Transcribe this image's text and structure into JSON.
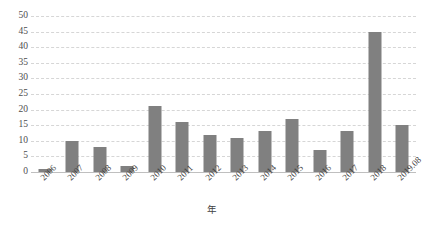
{
  "chart_data": {
    "type": "bar",
    "title": "",
    "subtitle": "",
    "xlabel": "年",
    "ylabel": "",
    "categories": [
      "2006",
      "2007",
      "2008",
      "2009",
      "2010",
      "2011",
      "2012",
      "2013",
      "2014",
      "2015",
      "2016",
      "2017",
      "2018",
      "2019.08"
    ],
    "values": [
      1,
      10,
      8,
      2,
      21,
      16,
      12,
      11,
      13,
      17,
      7,
      13,
      45,
      15
    ],
    "series": [
      {
        "name": "",
        "values": [
          1,
          10,
          8,
          2,
          21,
          16,
          12,
          11,
          13,
          17,
          7,
          13,
          45,
          15
        ]
      }
    ],
    "ylim": [
      0,
      50
    ],
    "y_ticks": [
      "0",
      "5",
      "10",
      "15",
      "20",
      "25",
      "30",
      "35",
      "40",
      "45",
      "50"
    ],
    "y_tick_values": [
      0,
      5,
      10,
      15,
      20,
      25,
      30,
      35,
      40,
      45,
      50
    ],
    "grid": true,
    "grid_axis": "y",
    "legend": false,
    "legend_position": "none",
    "bar_color": "#808080",
    "grid_color": "#d6d6d6",
    "axis_color": "#bfbfbf",
    "background_color": "#ffffff",
    "x_label_rotation": -45
  }
}
